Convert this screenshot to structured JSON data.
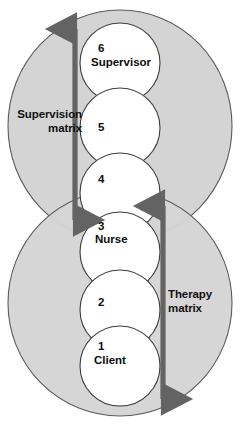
{
  "diagram": {
    "colors": {
      "ellipse_fill": "#d4d4d4",
      "ellipse_stroke": "#5b5b5b",
      "circle_fill": "#ffffff",
      "circle_stroke": "#3d3d3d",
      "arrow": "#636363",
      "text": "#0d0d0d",
      "background": "#ffffff"
    },
    "regions": [
      {
        "id": "supervision",
        "label": "Supervision\nmatrix",
        "label_align": "right"
      },
      {
        "id": "therapy",
        "label": "Therapy\nmatrix",
        "label_align": "left"
      }
    ],
    "nodes": [
      {
        "number": "6",
        "name": "Supervisor"
      },
      {
        "number": "5",
        "name": ""
      },
      {
        "number": "4",
        "name": ""
      },
      {
        "number": "3",
        "name": "Nurse"
      },
      {
        "number": "2",
        "name": ""
      },
      {
        "number": "1",
        "name": "Client"
      }
    ],
    "arrows": [
      {
        "id": "supervision-arrow",
        "orientation": "vertical",
        "heads": "double",
        "spans_nodes": "3 to 6"
      },
      {
        "id": "therapy-arrow",
        "orientation": "vertical",
        "heads": "double",
        "spans_nodes": "1 to 4"
      }
    ]
  }
}
